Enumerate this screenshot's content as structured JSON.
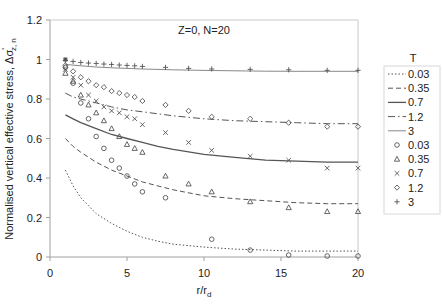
{
  "chart_data": {
    "type": "scatter",
    "title": "Z=0, N=20",
    "xlabel": "r/r",
    "xlabel_sub": "d",
    "ylabel": "Normalised vertical effective stress, Δσ",
    "ylabel_sub": "z, n",
    "ylabel_prime": "'",
    "xlim": [
      0,
      20
    ],
    "ylim": [
      0,
      1.2
    ],
    "xticks": [
      0,
      5,
      10,
      15,
      20
    ],
    "yticks": [
      0,
      0.2,
      0.4,
      0.6,
      0.8,
      1,
      1.2
    ],
    "ytick_labels": [
      "0",
      "0.2",
      "0.4",
      "0.6",
      "0.8",
      "1",
      "1.2"
    ],
    "grid": false,
    "legend": {
      "title": "T",
      "position": "right",
      "entries": [
        {
          "label": "0.03",
          "kind": "line",
          "style": "dotted"
        },
        {
          "label": "0.35",
          "kind": "line",
          "style": "dashed"
        },
        {
          "label": "0.7",
          "kind": "line",
          "style": "solid"
        },
        {
          "label": "1.2",
          "kind": "line",
          "style": "dashdot"
        },
        {
          "label": "3",
          "kind": "line",
          "style": "thin"
        },
        {
          "label": "0.03",
          "kind": "marker",
          "marker": "circle"
        },
        {
          "label": "0.35",
          "kind": "marker",
          "marker": "triangle"
        },
        {
          "label": "0.7",
          "kind": "marker",
          "marker": "x"
        },
        {
          "label": "1.2",
          "kind": "marker",
          "marker": "diamond"
        },
        {
          "label": "3",
          "kind": "marker",
          "marker": "plus"
        }
      ]
    },
    "line_series": [
      {
        "name": "T=0.03",
        "style": "dotted",
        "x": [
          1,
          1.5,
          2,
          3,
          4,
          5,
          6,
          7,
          8,
          10,
          12,
          14,
          16,
          18,
          20
        ],
        "y": [
          0.44,
          0.36,
          0.3,
          0.22,
          0.17,
          0.13,
          0.1,
          0.08,
          0.065,
          0.05,
          0.04,
          0.035,
          0.03,
          0.03,
          0.03
        ]
      },
      {
        "name": "T=0.35",
        "style": "dashed",
        "x": [
          1,
          1.5,
          2,
          3,
          4,
          5,
          6,
          7,
          8,
          10,
          12,
          14,
          16,
          18,
          20
        ],
        "y": [
          0.6,
          0.56,
          0.53,
          0.48,
          0.44,
          0.41,
          0.38,
          0.36,
          0.34,
          0.31,
          0.295,
          0.285,
          0.275,
          0.27,
          0.27
        ]
      },
      {
        "name": "T=0.7",
        "style": "solid",
        "x": [
          1,
          1.5,
          2,
          3,
          4,
          5,
          6,
          7,
          8,
          10,
          12,
          14,
          16,
          18,
          20
        ],
        "y": [
          0.72,
          0.7,
          0.68,
          0.65,
          0.62,
          0.6,
          0.58,
          0.56,
          0.545,
          0.52,
          0.505,
          0.49,
          0.485,
          0.48,
          0.48
        ]
      },
      {
        "name": "T=1.2",
        "style": "dashdot",
        "x": [
          1,
          1.5,
          2,
          3,
          4,
          5,
          6,
          7,
          8,
          10,
          12,
          14,
          16,
          18,
          20
        ],
        "y": [
          0.83,
          0.81,
          0.8,
          0.78,
          0.76,
          0.745,
          0.735,
          0.725,
          0.715,
          0.7,
          0.69,
          0.685,
          0.68,
          0.675,
          0.675
        ]
      },
      {
        "name": "T=3",
        "style": "thin",
        "x": [
          1,
          2,
          3,
          4,
          5,
          6,
          8,
          10,
          12,
          14,
          16,
          18,
          20
        ],
        "y": [
          0.975,
          0.968,
          0.962,
          0.958,
          0.955,
          0.952,
          0.948,
          0.945,
          0.943,
          0.941,
          0.94,
          0.94,
          0.94
        ]
      }
    ],
    "marker_series": [
      {
        "name": "T=0.03",
        "marker": "circle",
        "x": [
          1,
          1.5,
          2,
          2.5,
          3,
          3.5,
          4,
          4.5,
          5,
          5.5,
          6,
          7.5,
          10.5,
          13,
          15.5,
          18,
          20
        ],
        "y": [
          0.96,
          0.88,
          0.78,
          0.7,
          0.61,
          0.55,
          0.49,
          0.45,
          0.41,
          0.37,
          0.33,
          0.3,
          0.09,
          0.035,
          0.01,
          0.005,
          0.005
        ]
      },
      {
        "name": "T=0.35",
        "marker": "triangle",
        "x": [
          1,
          1.5,
          2,
          2.5,
          3,
          3.5,
          4,
          4.5,
          5,
          5.5,
          6,
          7.5,
          9,
          10.5,
          13,
          15.5,
          18,
          20
        ],
        "y": [
          0.93,
          0.89,
          0.82,
          0.77,
          0.73,
          0.69,
          0.65,
          0.61,
          0.57,
          0.55,
          0.53,
          0.41,
          0.37,
          0.33,
          0.28,
          0.25,
          0.23,
          0.23
        ]
      },
      {
        "name": "T=0.7",
        "marker": "x",
        "x": [
          1,
          1.5,
          2,
          2.5,
          3,
          3.5,
          4,
          4.5,
          5,
          5.5,
          6,
          7.5,
          9,
          10.5,
          13,
          15.5,
          18,
          20
        ],
        "y": [
          0.95,
          0.91,
          0.87,
          0.82,
          0.79,
          0.76,
          0.74,
          0.73,
          0.71,
          0.7,
          0.67,
          0.63,
          0.58,
          0.54,
          0.51,
          0.49,
          0.45,
          0.45
        ]
      },
      {
        "name": "T=1.2",
        "marker": "diamond",
        "x": [
          1,
          1.5,
          2,
          2.5,
          3,
          3.5,
          4,
          4.5,
          5,
          5.5,
          6,
          7.5,
          9,
          10.5,
          13,
          15.5,
          18,
          20
        ],
        "y": [
          0.97,
          0.94,
          0.91,
          0.89,
          0.87,
          0.86,
          0.84,
          0.83,
          0.82,
          0.81,
          0.79,
          0.77,
          0.74,
          0.71,
          0.7,
          0.68,
          0.66,
          0.66
        ]
      },
      {
        "name": "T=3",
        "marker": "plus",
        "x": [
          1,
          1.5,
          2,
          2.5,
          3,
          3.5,
          4,
          4.5,
          5,
          5.5,
          6,
          7.5,
          9,
          10.5,
          13,
          15.5,
          18,
          20
        ],
        "y": [
          0.995,
          0.99,
          0.985,
          0.982,
          0.98,
          0.977,
          0.975,
          0.972,
          0.97,
          0.968,
          0.965,
          0.96,
          0.955,
          0.952,
          0.95,
          0.948,
          0.945,
          0.945
        ]
      }
    ],
    "start_marker": {
      "x": 1,
      "y": 1.0,
      "marker": "square"
    }
  },
  "colors": {
    "axis": "#a0a0a0",
    "series": "#555555",
    "text": "#222222",
    "legend_border": "#d8d8d8"
  }
}
